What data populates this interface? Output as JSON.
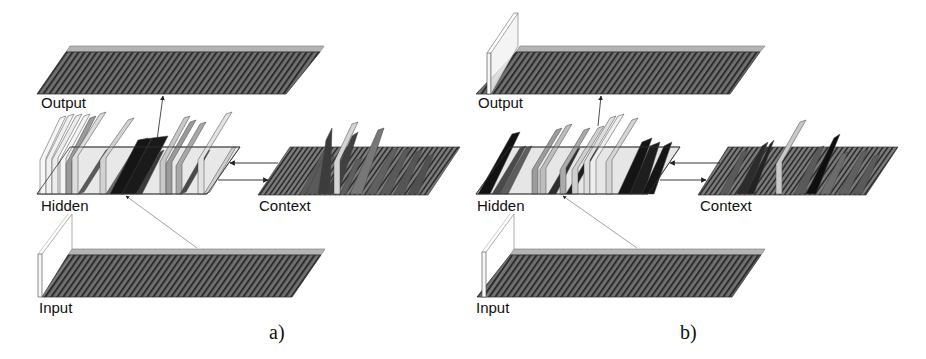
{
  "figure": {
    "panels": [
      {
        "id": "a",
        "caption": "a)",
        "labels": {
          "output": "Output",
          "hidden": "Hidden",
          "context": "Context",
          "input": "Input"
        }
      },
      {
        "id": "b",
        "caption": "b)",
        "labels": {
          "output": "Output",
          "hidden": "Hidden",
          "context": "Context",
          "input": "Input"
        }
      }
    ],
    "colors": {
      "plane_fill": "#6e6e6e",
      "plane_hatch": "#2a2a2a",
      "plane_top_edge": "#b4b4b4",
      "bar_black": "#151515",
      "bar_dark": "#5a5a5a",
      "bar_mid": "#9a9a9a",
      "bar_light": "#d2d2d2",
      "bar_white": "#f4f4f4",
      "arrow": "#222222"
    }
  }
}
